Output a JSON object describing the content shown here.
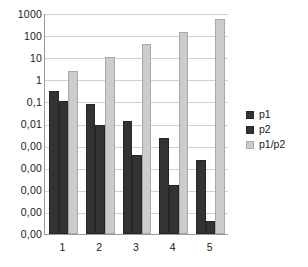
{
  "chart_data": {
    "type": "bar",
    "title": "",
    "subtitle": "",
    "xlabel": "",
    "ylabel": "",
    "categories": [
      "1",
      "2",
      "3",
      "4",
      "5"
    ],
    "series": [
      {
        "name": "p1",
        "values": [
          0.3,
          0.08,
          0.013,
          0.0022,
          0.00022
        ]
      },
      {
        "name": "p2",
        "values": [
          0.11,
          0.0088,
          0.00036,
          1.6e-05,
          4e-07
        ]
      },
      {
        "name": "p1/p2",
        "values": [
          2.5,
          10,
          40,
          140,
          550
        ]
      }
    ],
    "y_scale": "log",
    "ylim": [
      1e-07,
      1000
    ],
    "y_tick_values": [
      1000,
      100,
      10,
      1,
      0.1,
      0.01,
      0.001,
      0.0001,
      1e-05,
      1e-06,
      1e-07
    ],
    "y_tick_labels": [
      "1000",
      "100",
      "10",
      "1",
      "0,1",
      "0,01",
      "0,00",
      "0,00",
      "0,00",
      "0,00",
      "0,00"
    ],
    "x_tick_labels": [
      "1",
      "2",
      "3",
      "4",
      "5"
    ],
    "grid": true,
    "grid_axis": "y",
    "legend": [
      "p1",
      "p2",
      "p1/p2"
    ],
    "legend_position": "right",
    "colors": {
      "series_p1": "#333333",
      "series_p2": "#333333",
      "series_ratio": "#cccccc",
      "gridline": "#d0d0d0",
      "axis": "#9a9a9a",
      "background": "#ffffff",
      "text": "#1a1a1a"
    }
  }
}
